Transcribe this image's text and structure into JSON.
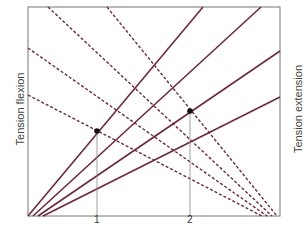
{
  "chart_data": {
    "type": "line",
    "title": "",
    "ylabel_left": "Tension flexion",
    "ylabel_right": "Tension extension",
    "xlabel": "",
    "x_ticks": [
      "1",
      "2"
    ],
    "grid": false,
    "line_color": "#6b2a3a",
    "solid_series": [
      {
        "name": "extension-1",
        "from": [
          28,
          216
        ],
        "to": [
          203,
          7
        ]
      },
      {
        "name": "extension-2",
        "from": [
          33,
          216
        ],
        "to": [
          261,
          7
        ]
      },
      {
        "name": "extension-3",
        "from": [
          38,
          216
        ],
        "to": [
          280,
          51
        ]
      },
      {
        "name": "extension-4",
        "from": [
          43,
          216
        ],
        "to": [
          280,
          97
        ]
      }
    ],
    "dashed_series": [
      {
        "name": "flexion-1",
        "from": [
          28,
          95
        ],
        "to": [
          262,
          216
        ]
      },
      {
        "name": "flexion-2",
        "from": [
          28,
          48
        ],
        "to": [
          267,
          216
        ]
      },
      {
        "name": "flexion-3",
        "from": [
          48,
          7
        ],
        "to": [
          272,
          216
        ]
      },
      {
        "name": "flexion-4",
        "from": [
          107,
          7
        ],
        "to": [
          277,
          216
        ]
      }
    ],
    "points": [
      {
        "label": "1",
        "x": 97,
        "y": 131
      },
      {
        "label": "2",
        "x": 190,
        "y": 111
      }
    ],
    "plot_box": {
      "left": 28,
      "top": 7,
      "right": 280,
      "bottom": 216
    }
  }
}
